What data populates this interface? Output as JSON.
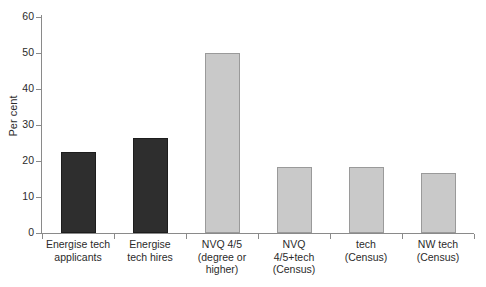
{
  "chart_data": {
    "type": "bar",
    "title": "",
    "subtitle": "",
    "xlabel": "",
    "ylabel": "Per cent",
    "ylim": [
      0,
      60
    ],
    "yticks": [
      0,
      10,
      20,
      30,
      40,
      50,
      60
    ],
    "ytick_labels": [
      "0",
      "10",
      "20",
      "30",
      "40",
      "50",
      "60"
    ],
    "grid": false,
    "legend": null,
    "categories": [
      "Energise tech\napplicants",
      "Energise\ntech hires",
      "NVQ 4/5\n(degree or\nhigher)",
      "NVQ\n4/5+tech\n(Census)",
      "tech\n(Census)",
      "NW tech\n(Census)"
    ],
    "values": [
      22.4,
      26.4,
      50.0,
      18.3,
      18.3,
      16.7
    ],
    "bar_colors": [
      "#2e2e2e",
      "#2e2e2e",
      "#c9c9c9",
      "#c9c9c9",
      "#c9c9c9",
      "#c9c9c9"
    ],
    "bar_styles": [
      "dark",
      "dark",
      "light",
      "light",
      "light",
      "light"
    ]
  },
  "colors": {
    "dark_bar": "#2e2e2e",
    "light_bar": "#c9c9c9",
    "axis": "#8a8a8a",
    "text": "#2b2b2b",
    "background": "#ffffff"
  }
}
